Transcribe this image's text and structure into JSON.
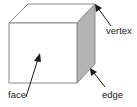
{
  "diagram": {
    "labels": {
      "vertex": "vertex",
      "face": "face",
      "edge": "edge"
    },
    "colors": {
      "outline": "#8a8a8a",
      "side_face": "#b3b3b3",
      "front_face": "#ffffff",
      "arrow": "#1a1a1a",
      "text": "#222222"
    }
  }
}
